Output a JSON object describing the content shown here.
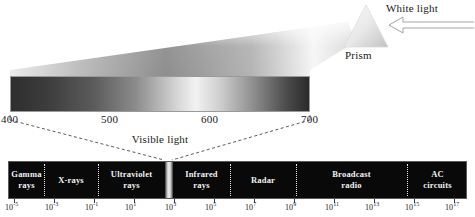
{
  "figure": {
    "background_color": "#ffffff",
    "text_color": "#1a1a1a"
  },
  "prism": {
    "label": "Prism",
    "white_light_label": "White light",
    "arrow_direction": "left",
    "fill_light": "#f4f4f4",
    "fill_dark": "#b8b8b8"
  },
  "visible_spectrum": {
    "caption": "Visible light",
    "wavelength_unit": "nm",
    "axis_ticks": [
      {
        "label": "400",
        "x": 10
      },
      {
        "label": "500",
        "x": 110
      },
      {
        "label": "600",
        "x": 210
      },
      {
        "label": "700",
        "x": 310
      }
    ],
    "gradient_stops": [
      {
        "pos": 0,
        "color": "#2e2e2e"
      },
      {
        "pos": 12,
        "color": "#3c3c3c"
      },
      {
        "pos": 28,
        "color": "#5c5c5c"
      },
      {
        "pos": 42,
        "color": "#8c8c8c"
      },
      {
        "pos": 55,
        "color": "#d2d2d2"
      },
      {
        "pos": 62,
        "color": "#f2f2f2"
      },
      {
        "pos": 70,
        "color": "#cfcfcf"
      },
      {
        "pos": 82,
        "color": "#8a8a8a"
      },
      {
        "pos": 92,
        "color": "#4e4e4e"
      },
      {
        "pos": 100,
        "color": "#2a2a2a"
      }
    ]
  },
  "em_spectrum": {
    "bar_color": "#090909",
    "label_color": "#f2f2f2",
    "bands": [
      {
        "name": "gamma-rays",
        "label": "Gamma\nrays",
        "start": 8,
        "end": 43
      },
      {
        "name": "x-rays",
        "label": "X-rays",
        "start": 43,
        "end": 97
      },
      {
        "name": "ultraviolet-rays",
        "label": "Ultraviolet\nrays",
        "start": 97,
        "end": 164
      },
      {
        "name": "visible-light",
        "label": "",
        "start": 164,
        "end": 172
      },
      {
        "name": "infrared-rays",
        "label": "Infrared\nrays",
        "start": 172,
        "end": 229
      },
      {
        "name": "radar",
        "label": "Radar",
        "start": 229,
        "end": 295
      },
      {
        "name": "broadcast-radio",
        "label": "Broadcast\nradio",
        "start": 295,
        "end": 406
      },
      {
        "name": "ac-circuits",
        "label": "AC\ncircuits",
        "start": 406,
        "end": 467
      }
    ],
    "dividers": [
      43,
      97,
      164,
      229,
      295,
      406
    ],
    "axis_ticks": [
      {
        "mantissa": "10",
        "exponent": "-5",
        "x": 14
      },
      {
        "mantissa": "10",
        "exponent": "-3",
        "x": 54
      },
      {
        "mantissa": "10",
        "exponent": "-1",
        "x": 94
      },
      {
        "mantissa": "10",
        "exponent": "1",
        "x": 134
      },
      {
        "mantissa": "10",
        "exponent": "3",
        "x": 174
      },
      {
        "mantissa": "10",
        "exponent": "5",
        "x": 214
      },
      {
        "mantissa": "10",
        "exponent": "7",
        "x": 254
      },
      {
        "mantissa": "10",
        "exponent": "9",
        "x": 294
      },
      {
        "mantissa": "10",
        "exponent": "11",
        "x": 334
      },
      {
        "mantissa": "10",
        "exponent": "13",
        "x": 374
      },
      {
        "mantissa": "10",
        "exponent": "15",
        "x": 414
      },
      {
        "mantissa": "10",
        "exponent": "17",
        "x": 454
      }
    ]
  },
  "connectors": {
    "style": "dashed",
    "color": "#4a4a4a",
    "left_from_x": 10,
    "right_from_x": 310,
    "from_y": 120,
    "to_left_x": 164,
    "to_right_x": 172,
    "to_y": 160
  }
}
